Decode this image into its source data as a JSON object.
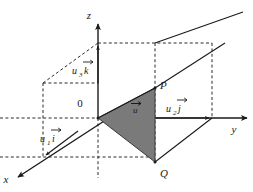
{
  "figure": {
    "background_color": "#ffffff",
    "line_color": "#1a1a1a",
    "shade_color": "#7a7a7a",
    "shade_edge_color": "#333333",
    "dash_color": "#2b2b2b"
  },
  "axes": [
    {
      "id": "z",
      "label": "z",
      "label_x": 89,
      "label_y": 19
    },
    {
      "id": "y",
      "label": "y",
      "label_x": 234,
      "label_y": 133
    },
    {
      "id": "x",
      "label": "x",
      "label_x": 6,
      "label_y": 183
    }
  ],
  "points": [
    {
      "id": "origin",
      "label": "0",
      "label_x": 80,
      "label_y": 107,
      "x": 98,
      "y": 118
    },
    {
      "id": "P",
      "label": "P",
      "label_x": 160,
      "label_y": 89,
      "x": 155,
      "y": 88
    },
    {
      "id": "Q",
      "label": "Q",
      "label_x": 160,
      "label_y": 177,
      "x": 155,
      "y": 162
    }
  ],
  "components": [
    {
      "id": "u1i",
      "base": "u",
      "subscript": "1",
      "unit": "i",
      "label_x": 48,
      "label_y": 142
    },
    {
      "id": "u2j",
      "base": "u",
      "subscript": "2",
      "unit": "j",
      "label_x": 173,
      "label_y": 112
    },
    {
      "id": "u3k",
      "base": "u",
      "subscript": "3",
      "unit": "k",
      "label_x": 80,
      "label_y": 74
    }
  ],
  "vector": {
    "id": "u",
    "label": "u",
    "label_x": 136,
    "label_y": 110
  },
  "shaded_triangle": {
    "name": "triangle-OPQ",
    "vertices": "98,118 155,88 155,162"
  }
}
